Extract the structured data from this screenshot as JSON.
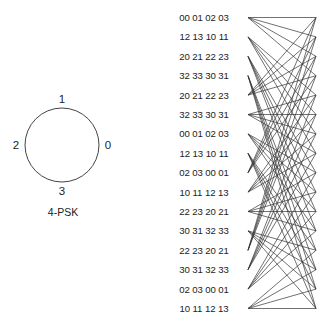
{
  "constellation": {
    "caption": "4-PSK",
    "points": [
      {
        "label": "0",
        "angle_deg": 0
      },
      {
        "label": "1",
        "angle_deg": 90
      },
      {
        "label": "2",
        "angle_deg": 180
      },
      {
        "label": "3",
        "angle_deg": 270
      }
    ],
    "center": [
      62,
      145
    ],
    "radius": 37
  },
  "trellis": {
    "num_states": 16,
    "left_x": 248,
    "right_x": 316,
    "top_y": 17.5,
    "row_spacing": 19.4,
    "line_color": "#333333",
    "row_labels": [
      "00 01 02 03",
      "12 13 10 11",
      "20 21 22 23",
      "32 33 30 31",
      "20 21 22 23",
      "32 33 30 31",
      "00 01 02 03",
      "12 13 10 11",
      "02 03 00 01",
      "10 11 12 13",
      "22 23 20 21",
      "30 31 32 33",
      "22 23 20 21",
      "30 31 32 33",
      "02 03 00 01",
      "10 11 12 13"
    ],
    "branch_rule": "state s connects to next states 4*(s mod 4) + k, k = 0..3"
  }
}
